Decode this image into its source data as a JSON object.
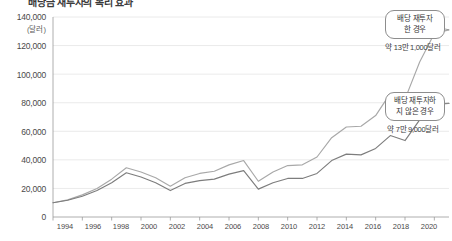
{
  "chart_data": {
    "type": "line",
    "title": "배당금 재투자의 복리 효과",
    "xlabel": "",
    "ylabel": "",
    "yunit": "(달러)",
    "ylim": [
      0,
      140000
    ],
    "yticks": [
      0,
      20000,
      40000,
      60000,
      80000,
      100000,
      120000,
      140000
    ],
    "ytick_labels": [
      "0",
      "20,000",
      "40,000",
      "60,000",
      "80,000",
      "100,000",
      "120,000",
      "140,000"
    ],
    "xlim": [
      1994,
      2021
    ],
    "xticks": [
      1994,
      1996,
      1998,
      2000,
      2002,
      2004,
      2006,
      2008,
      2010,
      2012,
      2014,
      2016,
      2018,
      2020
    ],
    "xtick_labels": [
      "1994",
      "1996",
      "1998",
      "2000",
      "2002",
      "2004",
      "2006",
      "2008",
      "2010",
      "2012",
      "2014",
      "2016",
      "2018",
      "2020"
    ],
    "grid": true,
    "legend_position": "none",
    "x": [
      1994,
      1995,
      1996,
      1997,
      1998,
      1999,
      2000,
      2001,
      2002,
      2003,
      2004,
      2005,
      2006,
      2007,
      2008,
      2009,
      2010,
      2011,
      2012,
      2013,
      2014,
      2015,
      2016,
      2017,
      2018,
      2019,
      2020,
      2021
    ],
    "series": [
      {
        "name": "배당 재투자 한 경우",
        "color": "#a8a8a8",
        "values": [
          10000,
          12000,
          15500,
          20000,
          26500,
          34500,
          31500,
          27500,
          21500,
          27500,
          30500,
          32000,
          36500,
          39500,
          25000,
          31500,
          36000,
          36500,
          42000,
          55500,
          63000,
          63500,
          71000,
          86500,
          82500,
          108500,
          128500,
          131000
        ]
      },
      {
        "name": "배당 재투자하지 않은 경우",
        "color": "#7d7d7d",
        "values": [
          10000,
          11700,
          14500,
          18500,
          24000,
          31000,
          28000,
          24000,
          18500,
          23500,
          25500,
          26500,
          30000,
          32500,
          19500,
          24000,
          27000,
          27000,
          30500,
          39500,
          44000,
          43500,
          48000,
          57000,
          53500,
          68000,
          79000,
          79500
        ]
      }
    ],
    "annotations": [
      {
        "id": "reinvested",
        "lines": [
          "배당 재투자",
          "한 경우"
        ],
        "value_label": "약 13만 1,000달러",
        "target_year": 2021,
        "target_value": 131000
      },
      {
        "id": "not-reinvested",
        "lines": [
          "배당 재투자하",
          "지 않은 경우"
        ],
        "value_label": "약 7만 9,000달러",
        "target_year": 2021,
        "target_value": 79000
      }
    ]
  }
}
